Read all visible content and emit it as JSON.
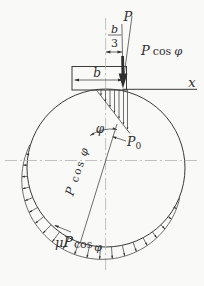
{
  "figure": {
    "background": "#f9f9f7",
    "line_color": "#3a3a3a",
    "centerline_color": "#b3b3b3"
  },
  "labels": {
    "P": "P",
    "b": "b",
    "three": "3",
    "cos": "cos",
    "phi": "φ",
    "mu": "μ",
    "zero": "0",
    "x": "x"
  },
  "geometry": {
    "circle": {
      "cx": 106,
      "cy": 168,
      "r": 79
    },
    "pressure": {
      "theta_start_deg": 22,
      "theta_end_deg": 197,
      "theta_contact_deg": 109.5,
      "max_depth_px": 13,
      "arrow_start_deg": 30,
      "arrow_end_deg": 190,
      "arrow_step_deg": 8,
      "min_arrow_depth_px": 2.0,
      "head_size_px": 3.2
    },
    "triangle_load": {
      "apex_x": 96,
      "top_y": 89.5,
      "end_x": 130,
      "end_y": 133,
      "arrow_xs": [
        101,
        105.5,
        110,
        114.5,
        119,
        123.5,
        127.5
      ],
      "head_size_px": 2.6
    }
  }
}
